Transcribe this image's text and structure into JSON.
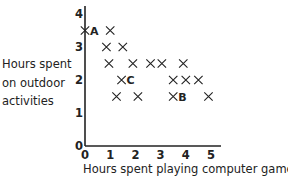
{
  "chart_data": {
    "type": "scatter",
    "title": "",
    "xlabel": "Hours spent playing computer games",
    "ylabel": "Hours spent on outdoor activities",
    "ylabel_lines": [
      "Hours spent",
      "on outdoor",
      "activities"
    ],
    "xlim": [
      0,
      5
    ],
    "ylim": [
      0,
      4
    ],
    "xticks": [
      "0",
      "1",
      "2",
      "3",
      "4",
      "5"
    ],
    "yticks": [
      "0",
      "1",
      "2",
      "3",
      "4"
    ],
    "grid": false,
    "legend": null,
    "marker": "x",
    "points": [
      {
        "x": 0,
        "y": 3.5,
        "label": "A"
      },
      {
        "x": 1,
        "y": 3.5,
        "label": ""
      },
      {
        "x": 0.85,
        "y": 3,
        "label": ""
      },
      {
        "x": 1.5,
        "y": 3,
        "label": ""
      },
      {
        "x": 0.95,
        "y": 2.5,
        "label": ""
      },
      {
        "x": 1.9,
        "y": 2.5,
        "label": ""
      },
      {
        "x": 2.6,
        "y": 2.5,
        "label": ""
      },
      {
        "x": 3.05,
        "y": 2.5,
        "label": ""
      },
      {
        "x": 3.9,
        "y": 2.5,
        "label": ""
      },
      {
        "x": 1.45,
        "y": 2,
        "label": "C"
      },
      {
        "x": 3.5,
        "y": 2,
        "label": ""
      },
      {
        "x": 4,
        "y": 2,
        "label": ""
      },
      {
        "x": 4.5,
        "y": 2,
        "label": ""
      },
      {
        "x": 1.25,
        "y": 1.5,
        "label": ""
      },
      {
        "x": 2.1,
        "y": 1.5,
        "label": ""
      },
      {
        "x": 3.5,
        "y": 1.5,
        "label": "B"
      },
      {
        "x": 4.9,
        "y": 1.5,
        "label": ""
      }
    ],
    "annotations": [
      "A",
      "B",
      "C"
    ]
  },
  "colors": {
    "ink": "#222222",
    "background": "#ffffff"
  }
}
